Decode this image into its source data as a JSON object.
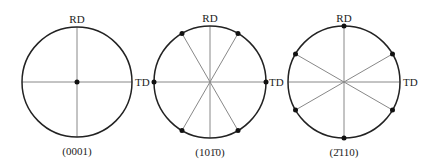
{
  "figure": {
    "type": "pole-figure-schematic",
    "axis_labels": {
      "rd": "RD",
      "td": "TD"
    },
    "colors": {
      "circle": "#222222",
      "line": "#888888",
      "dot": "#111111",
      "text": "#222222"
    },
    "panels": [
      {
        "caption": "(0001)",
        "center": [
          77,
          82
        ],
        "radius": 55,
        "line_angles_deg": [
          0,
          90
        ],
        "pole_angles_deg": [],
        "center_pole": true
      },
      {
        "caption": "(101̄0)",
        "center": [
          210,
          82
        ],
        "radius": 56,
        "line_angles_deg": [
          0,
          60,
          90,
          120
        ],
        "pole_angles_deg": [
          0,
          60,
          120,
          180,
          240,
          300
        ],
        "center_pole": false
      },
      {
        "caption": "(2̄110)",
        "center": [
          344,
          82
        ],
        "radius": 56,
        "line_angles_deg": [
          30,
          90,
          150,
          0
        ],
        "pole_angles_deg": [
          30,
          90,
          150,
          210,
          270,
          330
        ],
        "center_pole": false
      }
    ]
  }
}
